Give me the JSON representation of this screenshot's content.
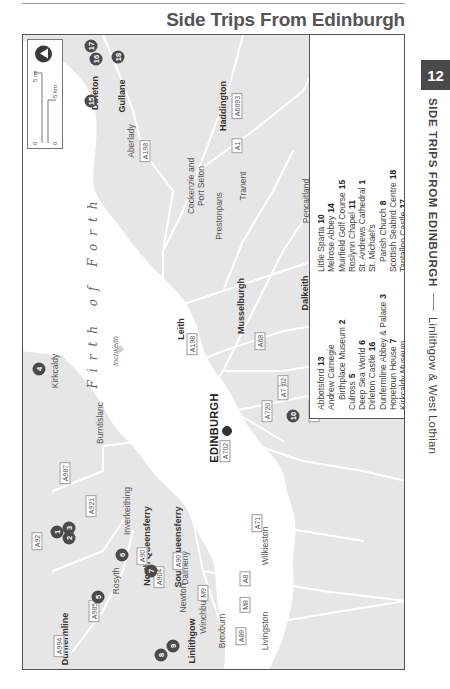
{
  "page": {
    "title": "Side Trips From Edinburgh",
    "chapter_number": "12",
    "running_head": {
      "section": "SIDE TRIPS FROM EDINBURGH",
      "subsection": "Linlithgow & West Lothian"
    }
  },
  "map": {
    "sea_label": "Firth of Forth",
    "island_label": "Inchkeith",
    "capital": "EDINBURGH",
    "towns": [
      {
        "name": "Dirleton",
        "bold": true
      },
      {
        "name": "Gullane",
        "bold": true
      },
      {
        "name": "Haddington",
        "bold": true
      },
      {
        "name": "Aberlady",
        "bold": false
      },
      {
        "name": "Tranent",
        "bold": false
      },
      {
        "name": "Pencaitland",
        "bold": false
      },
      {
        "name": "Cockenzie and",
        "bold": false
      },
      {
        "name": "Port Seton",
        "bold": false
      },
      {
        "name": "Prestonpans",
        "bold": false
      },
      {
        "name": "Musselburgh",
        "bold": true
      },
      {
        "name": "Dalkeith",
        "bold": true
      },
      {
        "name": "Bonnyrigg",
        "bold": true
      },
      {
        "name": "Pathead",
        "bold": false
      },
      {
        "name": "Humbie",
        "bold": false
      },
      {
        "name": "Gorebridge",
        "bold": false
      },
      {
        "name": "North Middleton",
        "bold": true
      },
      {
        "name": "Leith",
        "bold": true
      },
      {
        "name": "Loanhead",
        "bold": false
      },
      {
        "name": "Penicuik",
        "bold": true
      },
      {
        "name": "Kirkcaldy",
        "bold": false
      },
      {
        "name": "Burntislanc",
        "bold": false
      },
      {
        "name": "Inverkeithing",
        "bold": false
      },
      {
        "name": "North Queensferry",
        "bold": true
      },
      {
        "name": "South Queensferry",
        "bold": true
      },
      {
        "name": "Dalmeny",
        "bold": false
      },
      {
        "name": "Rosyth",
        "bold": false
      },
      {
        "name": "Dunfermline",
        "bold": true
      },
      {
        "name": "Newton",
        "bold": false
      },
      {
        "name": "Winchburgh",
        "bold": false
      },
      {
        "name": "Broxburn",
        "bold": false
      },
      {
        "name": "Livingston",
        "bold": false
      },
      {
        "name": "Wilkieston",
        "bold": false
      },
      {
        "name": "Linlithgow",
        "bold": true
      }
    ],
    "roads": [
      "A198",
      "A6093",
      "A1",
      "A6137",
      "A68",
      "A7",
      "A6094",
      "A701",
      "A702",
      "A703",
      "A720",
      "A198",
      "A68",
      "A702",
      "A7",
      "A92",
      "A987",
      "A921",
      "A90",
      "A985",
      "A994",
      "A904",
      "M9",
      "A90",
      "A8",
      "M8",
      "A89",
      "A71"
    ],
    "markers": [
      "1",
      "2",
      "3",
      "4",
      "5",
      "6",
      "7",
      "8",
      "9",
      "10",
      "11",
      "12",
      "13",
      "14",
      "15",
      "16",
      "17",
      "18"
    ],
    "scale": {
      "miles": "5 mi",
      "km": "5 km",
      "zero": "0"
    },
    "inset": {
      "country": "S C O T L A N D",
      "city": "Edinburgh",
      "area_label_1": "Area of",
      "area_label_2": "detail",
      "neighbor": "ENGLAND",
      "scale_mi": "20 mi",
      "scale_km": "20 km",
      "zero": "0"
    }
  },
  "legend": {
    "column_1": [
      {
        "name": "Abbotsford",
        "num": "13"
      },
      {
        "name": "Andrew Carnegie",
        "num": ""
      },
      {
        "name": "Birthplace Museum",
        "num": "2",
        "indent": true
      },
      {
        "name": "Culross",
        "num": "5"
      },
      {
        "name": "Deep Sea World",
        "num": "6"
      },
      {
        "name": "Dirleton Castle",
        "num": "16"
      },
      {
        "name": "Dunfermline Abbey & Palace",
        "num": "3"
      },
      {
        "name": "Hopetoun House",
        "num": "7"
      },
      {
        "name": "Kirkcaldy Museum",
        "num": ""
      },
      {
        "name": "& Art Gallery",
        "num": "4",
        "indent": true
      },
      {
        "name": "Linlithgow Palace",
        "num": "9"
      }
    ],
    "column_2": [
      {
        "name": "Little Sparta",
        "num": "10"
      },
      {
        "name": "Melrose Abbey",
        "num": "14"
      },
      {
        "name": "Muirfield Golf Course",
        "num": "15"
      },
      {
        "name": "Roslynn Chapel",
        "num": "11"
      },
      {
        "name": "St. Andrews Cathedral",
        "num": "1"
      },
      {
        "name": "St. Michael's",
        "num": ""
      },
      {
        "name": "Parish Church",
        "num": "8",
        "indent": true
      },
      {
        "name": "Scottish Seabird Centre",
        "num": "18"
      },
      {
        "name": "Tantallon Castle",
        "num": "17"
      },
      {
        "name": "Traquair House",
        "num": "12"
      },
      {
        "name": "University of St. Andrews",
        "num": "1"
      }
    ]
  },
  "colors": {
    "land": "#e6e6e6",
    "water": "#ffffff",
    "road": "#ffffff",
    "marker": "#4a4a4a",
    "chapter_tab": "#4a4a4a"
  }
}
